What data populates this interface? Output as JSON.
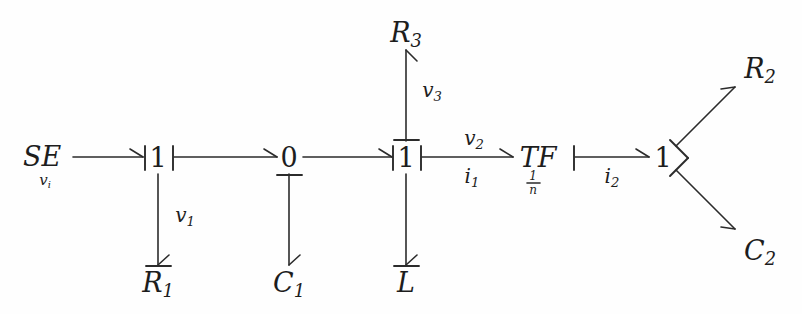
{
  "diagram": {
    "type": "bond-graph",
    "background_color": "#fefefe",
    "ink_color": "#2b2b2b"
  },
  "nodes": {
    "source": {
      "label": "SE",
      "subscript": "v",
      "sub_subscript": "i",
      "effort_label": "v_i",
      "x": 42,
      "y": 160
    },
    "junction_1a": {
      "label": "1",
      "x": 158,
      "y": 160
    },
    "junction_0": {
      "label": "0",
      "x": 289,
      "y": 160
    },
    "junction_1b": {
      "label": "1",
      "x": 406,
      "y": 160
    },
    "transformer": {
      "label": "TF",
      "modulus_num": "1",
      "modulus_den": "n",
      "x": 538,
      "y": 160
    },
    "junction_1c": {
      "label": "1",
      "x": 663,
      "y": 160
    },
    "r1": {
      "label": "R",
      "sub": "1",
      "x": 158,
      "y": 283
    },
    "c1": {
      "label": "C",
      "sub": "1",
      "x": 289,
      "y": 283
    },
    "inductor": {
      "label": "L",
      "sub": "",
      "x": 406,
      "y": 283
    },
    "r3": {
      "label": "R",
      "sub": "3",
      "x": 406,
      "y": 36
    },
    "r2": {
      "label": "R",
      "sub": "2",
      "x": 757,
      "y": 73
    },
    "c2": {
      "label": "C",
      "sub": "2",
      "x": 757,
      "y": 253
    }
  },
  "bond_labels": {
    "vi": {
      "text": "v",
      "sub": "i"
    },
    "v1": {
      "text": "v",
      "sub": "1"
    },
    "v2": {
      "text": "v",
      "sub": "2"
    },
    "v3": {
      "text": "v",
      "sub": "3"
    },
    "i1": {
      "text": "i",
      "sub": "1"
    },
    "i2": {
      "text": "i",
      "sub": "2"
    }
  },
  "bonds": [
    {
      "name": "se-to-1a",
      "from": "source",
      "to": "junction_1a",
      "label": "",
      "causality": "at-target"
    },
    {
      "name": "1a-to-0",
      "from": "junction_1a",
      "to": "junction_0",
      "label": "",
      "causality": "at-source"
    },
    {
      "name": "1a-to-r1",
      "from": "junction_1a",
      "to": "r1",
      "label": "v1",
      "causality": "at-target"
    },
    {
      "name": "0-to-c1",
      "from": "junction_0",
      "to": "c1",
      "label": "",
      "causality": "at-source"
    },
    {
      "name": "0-to-1b",
      "from": "junction_0",
      "to": "junction_1b",
      "label": "",
      "causality": "at-target"
    },
    {
      "name": "r3-to-1b",
      "from": "r3",
      "to": "junction_1b",
      "label": "v3",
      "causality": "at-target"
    },
    {
      "name": "1b-to-l",
      "from": "junction_1b",
      "to": "inductor",
      "label": "",
      "causality": "at-target"
    },
    {
      "name": "1b-to-tf",
      "from": "junction_1b",
      "to": "transformer",
      "label_top": "v2",
      "label_bottom": "i1",
      "causality": "at-source"
    },
    {
      "name": "tf-to-1c",
      "from": "transformer",
      "to": "junction_1c",
      "label_bottom": "i2",
      "causality": "at-source"
    },
    {
      "name": "1c-to-r2",
      "from": "junction_1c",
      "to": "r2",
      "label": "",
      "causality": "at-source"
    },
    {
      "name": "1c-to-c2",
      "from": "junction_1c",
      "to": "c2",
      "label": "",
      "causality": "at-source"
    }
  ]
}
